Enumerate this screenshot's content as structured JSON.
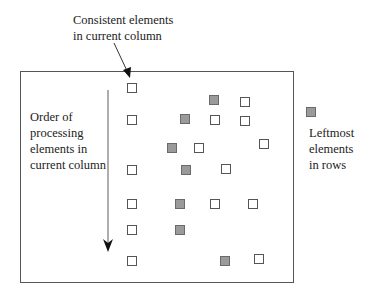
{
  "labels": {
    "top_line1": "Consistent elements",
    "top_line2": "in current column",
    "left_line1": "Order of",
    "left_line2": "processing",
    "left_line3": "elements in",
    "left_line4": "current column",
    "legend_line1": "Leftmost",
    "legend_line2": "elements",
    "legend_line3": "in rows"
  },
  "colors": {
    "gray_fill": "#9a9a9a",
    "gray_border": "#6a6a6a",
    "white_border": "#555555",
    "frame": "#555555"
  },
  "squares": [
    {
      "x": 127,
      "y": 83,
      "type": "white"
    },
    {
      "x": 209,
      "y": 95,
      "type": "gray"
    },
    {
      "x": 240,
      "y": 97,
      "type": "white"
    },
    {
      "x": 127,
      "y": 115,
      "type": "white"
    },
    {
      "x": 180,
      "y": 114,
      "type": "gray"
    },
    {
      "x": 210,
      "y": 115,
      "type": "white"
    },
    {
      "x": 240,
      "y": 116,
      "type": "white"
    },
    {
      "x": 167,
      "y": 143,
      "type": "gray"
    },
    {
      "x": 194,
      "y": 143,
      "type": "white"
    },
    {
      "x": 259,
      "y": 139,
      "type": "white"
    },
    {
      "x": 127,
      "y": 165,
      "type": "white"
    },
    {
      "x": 181,
      "y": 165,
      "type": "gray"
    },
    {
      "x": 221,
      "y": 164,
      "type": "white"
    },
    {
      "x": 127,
      "y": 199,
      "type": "white"
    },
    {
      "x": 175,
      "y": 199,
      "type": "gray"
    },
    {
      "x": 210,
      "y": 199,
      "type": "white"
    },
    {
      "x": 248,
      "y": 199,
      "type": "white"
    },
    {
      "x": 127,
      "y": 225,
      "type": "white"
    },
    {
      "x": 175,
      "y": 225,
      "type": "gray"
    },
    {
      "x": 127,
      "y": 256,
      "type": "white"
    },
    {
      "x": 220,
      "y": 256,
      "type": "gray"
    },
    {
      "x": 254,
      "y": 254,
      "type": "white"
    }
  ],
  "legend_square": {
    "x": 306,
    "y": 107,
    "type": "gray"
  }
}
